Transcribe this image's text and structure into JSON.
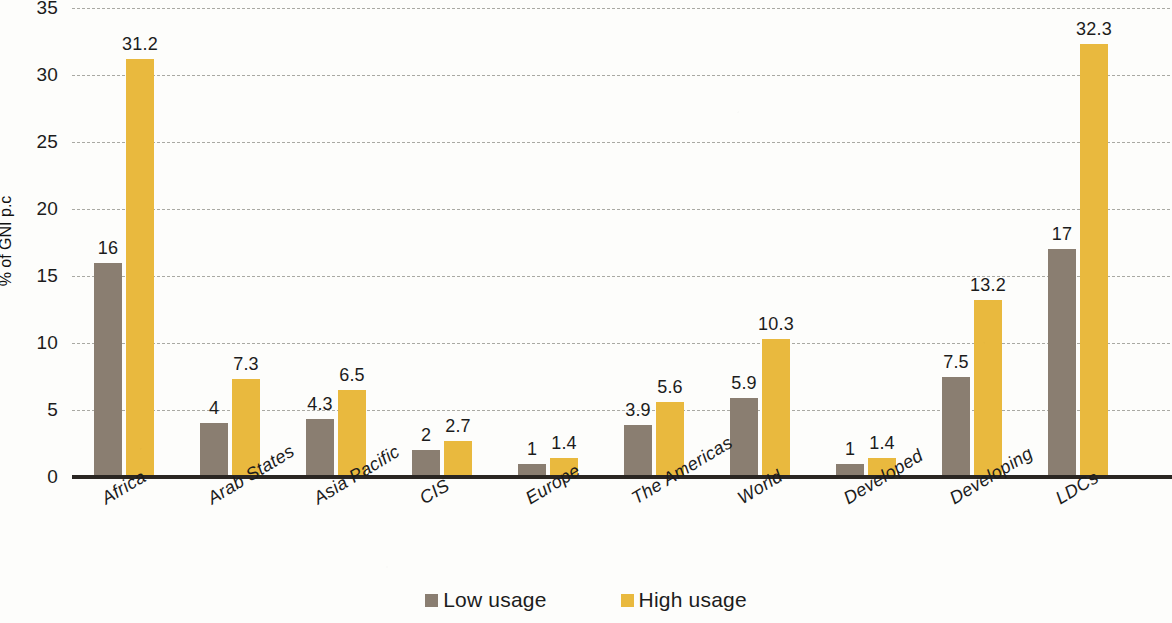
{
  "chart_data": {
    "type": "bar",
    "title": "",
    "subtitle": "",
    "xlabel": "",
    "ylabel": "% of GNI p.c",
    "ylim": [
      0,
      35
    ],
    "yticks": [
      0,
      5,
      10,
      15,
      20,
      25,
      30,
      35
    ],
    "ytick_labels": [
      "0",
      "5",
      "10",
      "15",
      "20",
      "25",
      "30",
      "35"
    ],
    "grid": true,
    "grid_style": "dashed-horizontal",
    "legend_position": "bottom-center",
    "categories": [
      "Africa",
      "Arab States",
      "Asia Pacific",
      "CIS",
      "Europe",
      "The Americas",
      "World",
      "Developed",
      "Developing",
      "LDCs"
    ],
    "series": [
      {
        "name": "Low usage",
        "color": "#8a7e71",
        "values": [
          16,
          4,
          4.3,
          2,
          1,
          3.9,
          5.9,
          1,
          7.5,
          17
        ],
        "labels": [
          "16",
          "4",
          "4.3",
          "2",
          "1",
          "3.9",
          "5.9",
          "1",
          "7.5",
          "17"
        ]
      },
      {
        "name": "High usage",
        "color": "#e9b93e",
        "values": [
          31.2,
          7.3,
          6.5,
          2.7,
          1.4,
          5.6,
          10.3,
          1.4,
          13.2,
          32.3
        ],
        "labels": [
          "31.2",
          "7.3",
          "6.5",
          "2.7",
          "1.4",
          "5.6",
          "10.3",
          "1.4",
          "13.2",
          "32.3"
        ]
      }
    ]
  },
  "legend": {
    "items": [
      {
        "label": "Low usage",
        "color": "#8a7e71"
      },
      {
        "label": "High usage",
        "color": "#e9b93e"
      }
    ]
  },
  "colors": {
    "low_usage": "#8a7e71",
    "high_usage": "#e9b93e",
    "axis": "#2a2622",
    "gridline": "#a9a9a3",
    "background": "#fdfdfb",
    "text": "#1c1c1c"
  }
}
